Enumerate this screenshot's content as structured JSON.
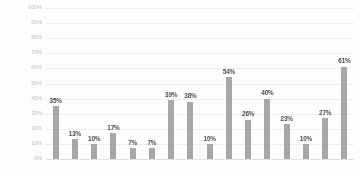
{
  "chart_data": {
    "type": "bar",
    "title": "",
    "subtitle": "",
    "xlabel": "",
    "ylabel": "",
    "ylim": [
      0,
      100
    ],
    "grid": true,
    "legend": "none",
    "bar_color": "#9b9b9b",
    "gridline_color": "#ededed",
    "axis_text_color": "#b9b9b9",
    "label_color": "#4d4d4d",
    "y_ticks": [
      "0%",
      "10%",
      "20%",
      "30%",
      "40%",
      "50%",
      "60%",
      "70%",
      "80%",
      "90%",
      "100%"
    ],
    "y_tick_values": [
      0,
      10,
      20,
      30,
      40,
      50,
      60,
      70,
      80,
      90,
      100
    ],
    "categories": [
      "",
      "",
      "",
      "",
      "",
      "",
      "",
      "",
      "",
      "",
      "",
      "",
      "",
      "",
      "",
      "",
      ""
    ],
    "values": [
      35,
      13,
      10,
      17,
      7,
      7,
      39,
      38,
      10,
      54,
      26,
      40,
      23,
      10,
      27,
      61,
      54
    ],
    "bars": [
      {
        "value": 35,
        "label": "35%"
      },
      {
        "value": 13,
        "label": "13%"
      },
      {
        "value": 10,
        "label": "10%"
      },
      {
        "value": 17,
        "label": "17%"
      },
      {
        "value": 7,
        "label": "7%"
      },
      {
        "value": 7,
        "label": "7%"
      },
      {
        "value": 39,
        "label": "39%"
      },
      {
        "value": 38,
        "label": "38%"
      },
      {
        "value": 10,
        "label": "10%"
      },
      {
        "value": 54,
        "label": "54%"
      },
      {
        "value": 26,
        "label": "26%"
      },
      {
        "value": 40,
        "label": "40%"
      },
      {
        "value": 23,
        "label": "23%"
      },
      {
        "value": 10,
        "label": "10%"
      },
      {
        "value": 27,
        "label": "27%"
      },
      {
        "value": 61,
        "label": "61%"
      }
    ]
  },
  "artifacts": {
    "mark_a": "·",
    "mark_b": "·"
  }
}
